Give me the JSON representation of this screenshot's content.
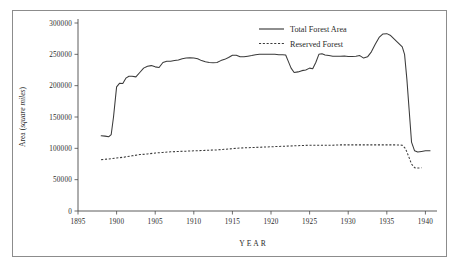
{
  "chart_data": {
    "type": "line",
    "title": "",
    "xlabel": "YEAR",
    "ylabel": "Area (square miles)",
    "ylabel_plain": "Area (",
    "ylabel_italic": "square miles",
    "ylabel_close": ")",
    "xlim": [
      1895,
      1941.5
    ],
    "ylim": [
      0,
      300000
    ],
    "grid": false,
    "legend_position": "top-right",
    "xticks": [
      1895,
      1900,
      1905,
      1910,
      1915,
      1920,
      1925,
      1930,
      1935,
      1940
    ],
    "xtick_labels": [
      "1895",
      "1900",
      "1905",
      "1910",
      "1915",
      "1920",
      "1925",
      "1930",
      "1935",
      "1940"
    ],
    "yticks": [
      0,
      50000,
      100000,
      150000,
      200000,
      250000,
      300000
    ],
    "ytick_labels": [
      "0",
      "50000",
      "100000",
      "150000",
      "200000",
      "250000",
      "300000"
    ],
    "series": [
      {
        "name": "Total Forest Area",
        "style": "solid",
        "color": "#3a3a3a",
        "x": [
          1898.0,
          1898.5,
          1899.0,
          1899.3,
          1899.6,
          1900.0,
          1900.4,
          1900.8,
          1901.2,
          1901.6,
          1902.0,
          1902.5,
          1903.0,
          1903.5,
          1904.0,
          1904.5,
          1905.0,
          1905.5,
          1906.0,
          1906.5,
          1907.0,
          1907.5,
          1908.0,
          1908.5,
          1909.0,
          1909.5,
          1910.0,
          1910.5,
          1911.0,
          1911.5,
          1912.0,
          1912.5,
          1913.0,
          1913.5,
          1914.0,
          1914.5,
          1915.0,
          1915.5,
          1916.0,
          1916.5,
          1917.0,
          1917.5,
          1918.0,
          1918.5,
          1919.0,
          1919.5,
          1920.0,
          1920.5,
          1921.0,
          1921.5,
          1921.9,
          1922.2,
          1922.6,
          1923.0,
          1923.5,
          1924.0,
          1924.5,
          1925.0,
          1925.4,
          1925.8,
          1926.2,
          1926.6,
          1927.0,
          1927.5,
          1928.0,
          1928.5,
          1929.0,
          1929.5,
          1930.0,
          1930.5,
          1931.0,
          1931.5,
          1932.0,
          1932.5,
          1933.0,
          1933.5,
          1934.0,
          1934.5,
          1935.0,
          1935.5,
          1936.0,
          1936.5,
          1937.0,
          1937.3,
          1937.6,
          1937.9,
          1938.2,
          1938.6,
          1939.0,
          1939.5,
          1940.0,
          1940.6
        ],
        "y": [
          120000,
          119500,
          118500,
          122000,
          150000,
          198000,
          204000,
          203500,
          212000,
          215000,
          215000,
          214000,
          221000,
          228000,
          231000,
          232000,
          230000,
          229000,
          237000,
          239000,
          239000,
          240000,
          241000,
          243000,
          244000,
          244500,
          244000,
          243000,
          240000,
          238000,
          237000,
          236500,
          237000,
          240000,
          242000,
          245000,
          248500,
          248500,
          246000,
          246000,
          247000,
          248000,
          249500,
          250000,
          250000,
          250000,
          250000,
          250000,
          249500,
          249500,
          249000,
          240000,
          228000,
          221000,
          222000,
          224000,
          225000,
          228000,
          227000,
          237000,
          250000,
          251000,
          249000,
          248000,
          247000,
          247000,
          247000,
          247500,
          246500,
          246500,
          247000,
          248000,
          244000,
          246000,
          254000,
          266000,
          277000,
          282500,
          283000,
          280000,
          274000,
          268000,
          262000,
          250000,
          210000,
          160000,
          110000,
          96000,
          94000,
          95000,
          96000,
          96000
        ]
      },
      {
        "name": "Reserved Forest",
        "style": "dashed",
        "color": "#3a3a3a",
        "x": [
          1898.0,
          1899.0,
          1900.0,
          1901.0,
          1902.0,
          1903.0,
          1904.0,
          1905.0,
          1906.0,
          1907.0,
          1908.0,
          1909.0,
          1910.0,
          1911.0,
          1912.0,
          1913.0,
          1914.0,
          1915.0,
          1916.0,
          1917.0,
          1918.0,
          1919.0,
          1920.0,
          1921.0,
          1922.0,
          1923.0,
          1924.0,
          1925.0,
          1926.0,
          1927.0,
          1928.0,
          1929.0,
          1930.0,
          1931.0,
          1932.0,
          1933.0,
          1934.0,
          1935.0,
          1936.0,
          1937.0,
          1937.4,
          1937.8,
          1938.2,
          1938.6,
          1939.0,
          1939.5
        ],
        "y": [
          82000,
          83000,
          84500,
          86000,
          88000,
          90000,
          91000,
          92500,
          93500,
          94500,
          95000,
          95500,
          96000,
          96500,
          97000,
          97500,
          98500,
          99500,
          100500,
          101000,
          101500,
          102000,
          102500,
          103000,
          103500,
          104000,
          104500,
          105000,
          105000,
          105000,
          105000,
          105500,
          105500,
          105500,
          105500,
          105500,
          105500,
          105500,
          105500,
          105000,
          100000,
          88000,
          75000,
          69000,
          68500,
          69000
        ]
      }
    ]
  },
  "legend": {
    "items": [
      {
        "label": "Total Forest Area",
        "style": "solid"
      },
      {
        "label": "Reserved Forest",
        "style": "dashed"
      }
    ]
  }
}
